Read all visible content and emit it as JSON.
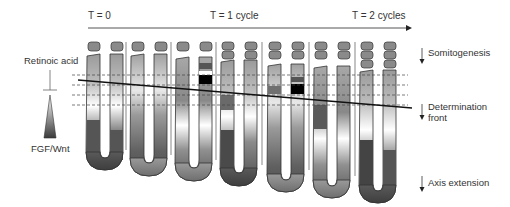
{
  "timeline": {
    "labels": [
      "T = 0",
      "T = 1 cycle",
      "T = 2 cycles"
    ]
  },
  "left_labels": {
    "top": "Retinoic acid",
    "bottom": "FGF/Wnt"
  },
  "right_labels": {
    "somitogenesis": "Somitogenesis",
    "determination_line1": "Determination",
    "determination_line2": "front",
    "axis_extension": "Axis extension"
  },
  "colors": {
    "line": "#333333",
    "somite": "#8a8a8a",
    "dark": "#4a4a4a",
    "light": "#ffffff",
    "black": "#000000"
  },
  "structures": {
    "count": 7,
    "description": "U-shaped presomitic mesoderm tails with somites budding at the top"
  }
}
